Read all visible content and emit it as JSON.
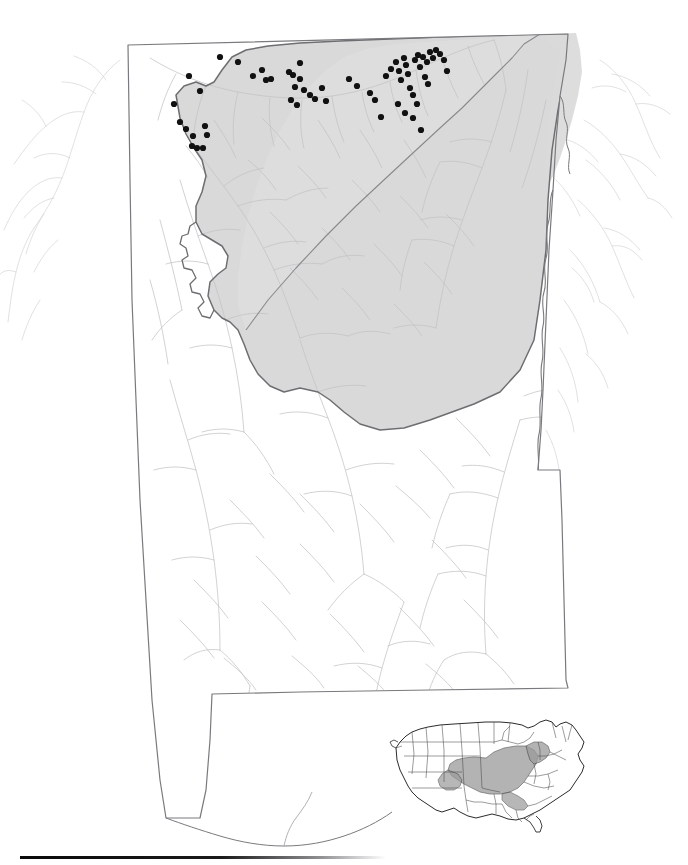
{
  "figure": {
    "kind": "species-distribution-map",
    "region_label": "Alabama",
    "caption": "",
    "background_color": "#ffffff"
  },
  "legend_semantics": {
    "occurrence_dot": "black filled circle marking a collection locality",
    "shaded_region": "shaded physiographic province / species range within state",
    "hydrography": "light gray river and stream network",
    "state_outline": "dark gray state boundary"
  },
  "colors": {
    "state_outline": "#7a7a7e",
    "province_outline": "#6e6e72",
    "province_fill": "#d9d9d9",
    "province_fill_secondary": "#dededd",
    "river": "#c3c3c6",
    "river_outside": "#d2d2d5",
    "dot": "#111111",
    "inset_outline": "#2b2b2b",
    "inset_state_line": "#4a4a4a",
    "inset_shade": "#9a9a9a",
    "rule": "#0a0a0a"
  },
  "main_map": {
    "name": "alabama-distribution-map",
    "bounds": {
      "x": 0,
      "y": 0,
      "width": 688,
      "height": 865
    }
  },
  "inset_map": {
    "name": "united-states-range-inset",
    "bounds": {
      "x": 382,
      "y": 712,
      "width": 216,
      "height": 122
    },
    "shaded_states": [
      "Illinois (southern)",
      "Indiana",
      "Ohio",
      "Kentucky",
      "Tennessee",
      "West Virginia",
      "Pennsylvania (western)",
      "Virginia (western)",
      "Alabama (northern)",
      "Georgia (northwestern)"
    ]
  },
  "chart_data": {
    "type": "scatter",
    "title": "",
    "xlabel": "",
    "ylabel": "",
    "point_radius_px": 3.1,
    "point_color": "#111111",
    "point_count": 62,
    "points": [
      [
        220,
        57
      ],
      [
        238,
        62
      ],
      [
        253,
        76
      ],
      [
        262,
        70
      ],
      [
        266,
        80
      ],
      [
        271,
        79
      ],
      [
        289,
        72
      ],
      [
        293,
        75
      ],
      [
        295,
        87
      ],
      [
        300,
        79
      ],
      [
        304,
        90
      ],
      [
        291,
        100
      ],
      [
        297,
        105
      ],
      [
        310,
        95
      ],
      [
        315,
        99
      ],
      [
        349,
        79
      ],
      [
        357,
        86
      ],
      [
        300,
        63
      ],
      [
        322,
        88
      ],
      [
        326,
        101
      ],
      [
        189,
        76
      ],
      [
        200,
        91
      ],
      [
        174,
        104
      ],
      [
        180,
        122
      ],
      [
        186,
        129
      ],
      [
        193,
        136
      ],
      [
        192,
        146
      ],
      [
        197,
        148
      ],
      [
        203,
        148
      ],
      [
        207,
        135
      ],
      [
        205,
        126
      ],
      [
        370,
        93
      ],
      [
        375,
        100
      ],
      [
        381,
        117
      ],
      [
        386,
        76
      ],
      [
        391,
        69
      ],
      [
        396,
        62
      ],
      [
        399,
        71
      ],
      [
        401,
        80
      ],
      [
        404,
        58
      ],
      [
        406,
        65
      ],
      [
        408,
        74
      ],
      [
        410,
        88
      ],
      [
        413,
        95
      ],
      [
        415,
        60
      ],
      [
        418,
        55
      ],
      [
        420,
        67
      ],
      [
        423,
        57
      ],
      [
        425,
        77
      ],
      [
        427,
        62
      ],
      [
        430,
        52
      ],
      [
        433,
        58
      ],
      [
        436,
        50
      ],
      [
        440,
        54
      ],
      [
        444,
        60
      ],
      [
        428,
        84
      ],
      [
        417,
        104
      ],
      [
        413,
        118
      ],
      [
        421,
        130
      ],
      [
        405,
        113
      ],
      [
        398,
        104
      ],
      [
        447,
        71
      ]
    ]
  }
}
